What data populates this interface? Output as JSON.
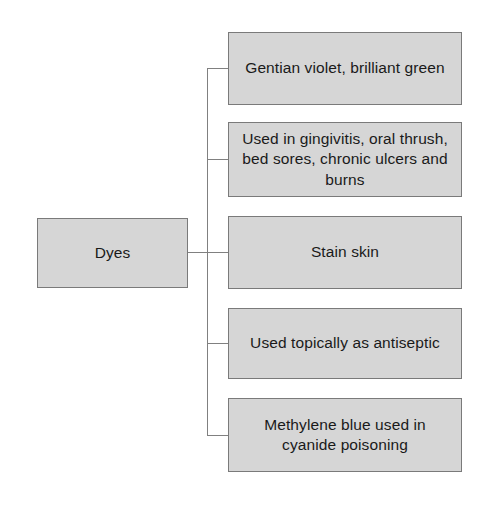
{
  "diagram": {
    "type": "bracket-tree",
    "root": {
      "label": "Dyes"
    },
    "branches": [
      {
        "label": "Gentian violet, brilliant green"
      },
      {
        "label": "Used in gingivitis, oral thrush, bed sores, chronic ulcers and burns"
      },
      {
        "label": "Stain skin"
      },
      {
        "label": "Used topically as antiseptic"
      },
      {
        "label": "Methylene blue used in cyanide poisoning"
      }
    ],
    "colors": {
      "box_fill": "#d6d6d6",
      "box_border": "#7a7a7a",
      "connector": "#808080",
      "text": "#1a1a1a",
      "background": "#ffffff"
    }
  }
}
